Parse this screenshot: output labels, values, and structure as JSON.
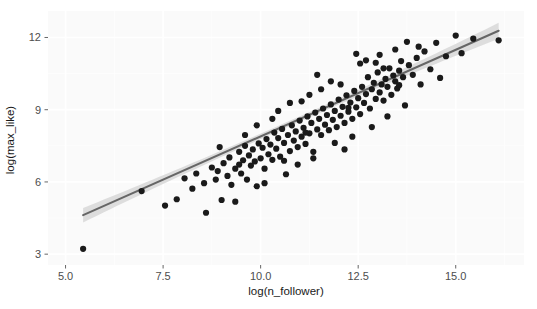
{
  "chart_data": {
    "type": "scatter",
    "title": "",
    "subtitle": "",
    "xlabel": "log(n_follower)",
    "ylabel": "log(max_like)",
    "xlim": [
      4.55,
      16.75
    ],
    "ylim": [
      2.55,
      13.1
    ],
    "xticks": [
      5.0,
      7.5,
      10.0,
      12.5,
      15.0
    ],
    "xticklabels": [
      "5.0",
      "7.5",
      "10.0",
      "12.5",
      "15.0"
    ],
    "yticks": [
      3,
      6,
      9,
      12
    ],
    "yticklabels": [
      "3",
      "6",
      "9",
      "12"
    ],
    "grid": true,
    "legend": "none",
    "point_color": "#1a1a1a",
    "point_size": 3.1,
    "panel_background": "#fafafa",
    "grid_color": "#ffffff",
    "fit": {
      "type": "linear-regression-with-confidence-band",
      "line_color": "#666666",
      "band_color": "#d9d9d9",
      "x_start": 5.45,
      "y_start": 4.62,
      "x_end": 16.1,
      "y_end": 12.28,
      "band_halfwidth_start": 0.3,
      "band_halfwidth_mid": 0.11,
      "band_halfwidth_end": 0.33
    },
    "points": [
      [
        5.45,
        3.22
      ],
      [
        6.95,
        5.62
      ],
      [
        7.55,
        5.02
      ],
      [
        7.85,
        5.28
      ],
      [
        8.05,
        6.15
      ],
      [
        8.25,
        5.72
      ],
      [
        8.35,
        6.35
      ],
      [
        8.55,
        5.95
      ],
      [
        8.6,
        4.72
      ],
      [
        8.75,
        6.6
      ],
      [
        8.85,
        6.1
      ],
      [
        8.9,
        6.45
      ],
      [
        9.0,
        5.25
      ],
      [
        9.05,
        6.78
      ],
      [
        9.15,
        6.25
      ],
      [
        9.2,
        7.02
      ],
      [
        9.25,
        5.88
      ],
      [
        9.35,
        6.55
      ],
      [
        9.45,
        7.25
      ],
      [
        9.5,
        6.35
      ],
      [
        9.55,
        6.9
      ],
      [
        9.6,
        7.5
      ],
      [
        9.65,
        6.1
      ],
      [
        9.7,
        7.1
      ],
      [
        9.75,
        6.68
      ],
      [
        9.8,
        7.35
      ],
      [
        9.85,
        6.85
      ],
      [
        9.9,
        5.82
      ],
      [
        9.95,
        7.6
      ],
      [
        10.0,
        6.98
      ],
      [
        10.05,
        7.42
      ],
      [
        10.1,
        6.55
      ],
      [
        10.15,
        7.78
      ],
      [
        10.2,
        7.15
      ],
      [
        10.25,
        7.55
      ],
      [
        10.3,
        6.92
      ],
      [
        10.35,
        8.05
      ],
      [
        10.4,
        7.38
      ],
      [
        10.45,
        7.82
      ],
      [
        10.5,
        7.05
      ],
      [
        10.55,
        8.2
      ],
      [
        10.6,
        7.62
      ],
      [
        10.65,
        6.32
      ],
      [
        10.7,
        7.95
      ],
      [
        10.75,
        7.28
      ],
      [
        10.8,
        8.35
      ],
      [
        10.85,
        7.72
      ],
      [
        10.9,
        8.1
      ],
      [
        10.95,
        7.45
      ],
      [
        11.0,
        8.55
      ],
      [
        11.05,
        7.88
      ],
      [
        11.1,
        8.25
      ],
      [
        11.15,
        7.58
      ],
      [
        11.2,
        8.72
      ],
      [
        11.25,
        8.02
      ],
      [
        11.3,
        8.45
      ],
      [
        11.35,
        7.25
      ],
      [
        11.4,
        8.88
      ],
      [
        11.45,
        8.18
      ],
      [
        11.5,
        8.62
      ],
      [
        11.55,
        7.95
      ],
      [
        11.6,
        9.05
      ],
      [
        11.65,
        8.38
      ],
      [
        11.7,
        8.78
      ],
      [
        11.75,
        8.15
      ],
      [
        11.8,
        9.22
      ],
      [
        11.85,
        8.58
      ],
      [
        11.9,
        8.95
      ],
      [
        11.95,
        8.28
      ],
      [
        12.0,
        9.42
      ],
      [
        12.05,
        8.75
      ],
      [
        12.1,
        9.12
      ],
      [
        12.15,
        8.45
      ],
      [
        12.2,
        9.6
      ],
      [
        12.25,
        8.92
      ],
      [
        12.3,
        9.3
      ],
      [
        12.35,
        8.62
      ],
      [
        12.4,
        9.78
      ],
      [
        12.45,
        9.1
      ],
      [
        12.5,
        9.48
      ],
      [
        12.55,
        8.82
      ],
      [
        12.6,
        9.95
      ],
      [
        12.65,
        9.28
      ],
      [
        12.7,
        9.65
      ],
      [
        12.75,
        10.35
      ],
      [
        12.8,
        9.05
      ],
      [
        12.85,
        9.85
      ],
      [
        12.9,
        10.12
      ],
      [
        12.95,
        9.45
      ],
      [
        13.0,
        10.55
      ],
      [
        13.05,
        9.72
      ],
      [
        13.1,
        10.05
      ],
      [
        13.15,
        9.38
      ],
      [
        13.2,
        10.28
      ],
      [
        13.25,
        9.95
      ],
      [
        13.3,
        10.72
      ],
      [
        13.35,
        9.62
      ],
      [
        13.4,
        10.42
      ],
      [
        13.45,
        10.18
      ],
      [
        13.5,
        9.88
      ],
      [
        13.55,
        10.62
      ],
      [
        13.6,
        11.02
      ],
      [
        13.65,
        10.35
      ],
      [
        13.7,
        9.18
      ],
      [
        13.8,
        10.85
      ],
      [
        13.9,
        10.45
      ],
      [
        14.0,
        11.15
      ],
      [
        14.1,
        10.05
      ],
      [
        14.2,
        11.42
      ],
      [
        14.35,
        10.68
      ],
      [
        14.5,
        11.78
      ],
      [
        14.6,
        10.32
      ],
      [
        14.75,
        11.22
      ],
      [
        15.0,
        12.08
      ],
      [
        15.15,
        11.35
      ],
      [
        15.45,
        11.95
      ],
      [
        16.1,
        11.88
      ],
      [
        12.15,
        7.35
      ],
      [
        11.35,
        6.98
      ],
      [
        10.1,
        5.95
      ],
      [
        9.35,
        5.18
      ],
      [
        12.55,
        10.92
      ],
      [
        13.05,
        11.28
      ],
      [
        14.05,
        11.62
      ],
      [
        11.55,
        9.85
      ],
      [
        11.05,
        9.35
      ],
      [
        12.85,
        8.28
      ],
      [
        13.25,
        8.72
      ],
      [
        12.35,
        7.88
      ],
      [
        10.45,
        8.95
      ],
      [
        9.9,
        8.35
      ],
      [
        11.8,
        10.18
      ],
      [
        12.7,
        11.05
      ],
      [
        13.45,
        11.5
      ],
      [
        10.95,
        6.72
      ],
      [
        9.6,
        7.95
      ],
      [
        11.25,
        9.62
      ],
      [
        12.05,
        10.05
      ],
      [
        12.95,
        10.95
      ],
      [
        10.75,
        9.28
      ],
      [
        11.9,
        7.62
      ],
      [
        13.55,
        10.02
      ],
      [
        8.95,
        7.45
      ],
      [
        10.3,
        8.62
      ],
      [
        11.45,
        10.45
      ],
      [
        12.45,
        11.32
      ],
      [
        13.75,
        11.82
      ],
      [
        11.15,
        8.05
      ],
      [
        10.6,
        6.88
      ],
      [
        12.25,
        9.08
      ],
      [
        13.15,
        10.72
      ],
      [
        9.45,
        6.72
      ]
    ]
  }
}
